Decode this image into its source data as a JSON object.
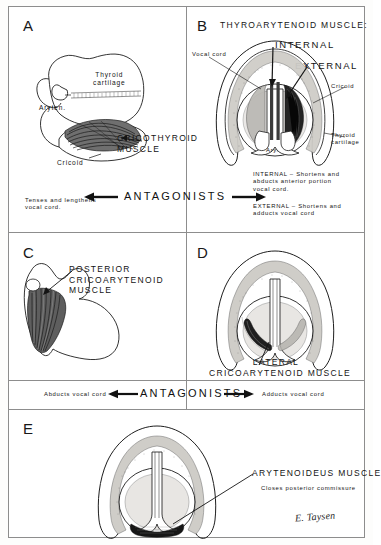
{
  "figure": {
    "title_hidden": "",
    "signature": "E. Taysen"
  },
  "panels": [
    {
      "letter": "A",
      "labels": {
        "thyroid_cartilage": "Thyroid\ncartilage",
        "arytenoid": "Aryten.",
        "cricoid": "Cricoid",
        "muscle": "CRICOTHYROID\nMUSCLE"
      },
      "caption": "Tenses and lengthens\nvocal cord."
    },
    {
      "letter": "B",
      "labels": {
        "heading": "THYROARYTENOID MUSCLE:",
        "internal": "INTERNAL",
        "external": "EXTERNAL",
        "vocal_cord": "Vocal cord",
        "arytenoid": "Ary.",
        "cricoid": "Cricoid",
        "thyroid_cartilage": "Thyroid\ncartilage"
      },
      "caption_internal": "INTERNAL – Shortens and\nabducts anterior portion\nvocal cord.",
      "caption_external": "EXTERNAL – Shortens and\nadducts vocal cord"
    },
    {
      "letter": "C",
      "labels": {
        "muscle": "POSTERIOR\nCRICOARYTENOID\nMUSCLE"
      },
      "caption": "Abducts vocal cord"
    },
    {
      "letter": "D",
      "labels": {
        "muscle": "LATERAL\nCRICOARYTENOID MUSCLE"
      },
      "caption": "Adducts vocal cord"
    },
    {
      "letter": "E",
      "labels": {
        "muscle": "ARYTENOIDEUS MUSCLE",
        "subtitle": "Closes posterior commissure"
      }
    }
  ],
  "antagonists": {
    "row1_label": "ANTAGONISTS",
    "row1_left_arrow": "left-arrow",
    "row1_right_arrow": "right-arrow",
    "row2_label": "ANTAGONISTS",
    "row2_left_text": "Abducts vocal cord",
    "row2_right_text": "Adducts vocal cord",
    "row2_left_arrow": "left-arrow",
    "row2_right_arrow": "right-arrow"
  },
  "colors": {
    "ink": "#141414",
    "frame": "#8d8d8d",
    "cartilage_fill": "#d9d7d2",
    "muscle_dark": "#2b2b2b",
    "page": "#ffffff"
  }
}
